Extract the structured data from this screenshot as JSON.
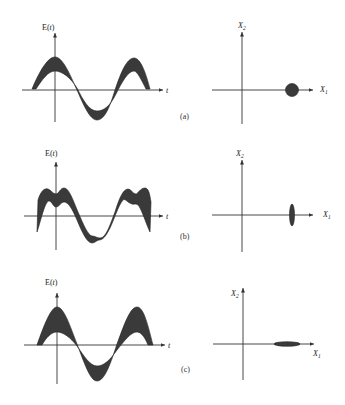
{
  "figure": {
    "panels": [
      {
        "id": "a",
        "label": "(a)",
        "waveform": {
          "y_axis_label": "E(t)",
          "x_axis_label": "t",
          "description": "sinusoid with uniform amplitude-noise band"
        },
        "phasor": {
          "y_axis_label": "X",
          "y_axis_sub": "2",
          "x_axis_label": "X",
          "x_axis_sub": "1",
          "noise_shape": "circle"
        }
      },
      {
        "id": "b",
        "label": "(b)",
        "waveform": {
          "y_axis_label": "E(t)",
          "x_axis_label": "t",
          "description": "sinusoid with phase-noise (amplitude-squeezed) band"
        },
        "phasor": {
          "y_axis_label": "X",
          "y_axis_sub": "2",
          "x_axis_label": "X",
          "x_axis_sub": "1",
          "noise_shape": "vertical ellipse"
        }
      },
      {
        "id": "c",
        "label": "(c)",
        "waveform": {
          "y_axis_label": "E(t)",
          "x_axis_label": "t",
          "description": "sinusoid with amplitude-noise band (phase-squeezed)"
        },
        "phasor": {
          "y_axis_label": "X",
          "y_axis_sub": "2",
          "x_axis_label": "X",
          "x_axis_sub": "1",
          "noise_shape": "horizontal ellipse"
        }
      }
    ]
  },
  "colors": {
    "ink": "#222222",
    "band_fill": "#3a3a3a",
    "background": "#ffffff"
  }
}
